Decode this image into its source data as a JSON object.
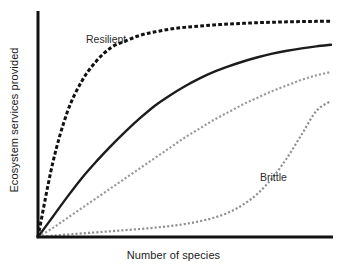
{
  "chart_data": {
    "type": "line",
    "title": "",
    "subtitle": "",
    "xlabel": "Number of species",
    "ylabel": "Ecosystem services provided",
    "xlim": [
      0,
      100
    ],
    "ylim": [
      0,
      100
    ],
    "grid": false,
    "axis_ticks": false,
    "tick_labels": {
      "x": [],
      "y": []
    },
    "legend": "none",
    "annotations": [
      {
        "text": "Resilient",
        "x": 17,
        "y": 88,
        "series": "resilient"
      },
      {
        "text": "Brittle",
        "x": 75,
        "y": 29,
        "series": "brittle"
      }
    ],
    "x": [
      0,
      5,
      10,
      15,
      20,
      25,
      30,
      35,
      40,
      45,
      50,
      55,
      60,
      65,
      70,
      75,
      80,
      85,
      90,
      95,
      100
    ],
    "series": [
      {
        "name": "resilient",
        "label": "Resilient",
        "style": "dashed",
        "color": "#111111",
        "width": 3,
        "values": [
          0,
          33,
          56,
          70,
          79,
          85,
          88,
          90.5,
          92,
          93.2,
          94,
          94.6,
          95.1,
          95.5,
          95.8,
          96.1,
          96.3,
          96.5,
          96.6,
          96.7,
          96.8
        ]
      },
      {
        "name": "intermediate-solid",
        "label": "",
        "style": "solid",
        "color": "#1c1c1c",
        "width": 2.4,
        "values": [
          0,
          9,
          18,
          26.5,
          34,
          41,
          47.5,
          53.5,
          59,
          63.5,
          67.5,
          71,
          74,
          76.5,
          78.7,
          80.6,
          82.2,
          83.5,
          84.6,
          85.5,
          86.2
        ]
      },
      {
        "name": "intermediate-dotted",
        "label": "",
        "style": "dotted",
        "color": "#9a9a9a",
        "width": 2.2,
        "values": [
          0,
          4,
          8.5,
          13,
          17.5,
          22,
          26.5,
          31,
          35.5,
          40,
          44.5,
          48.5,
          52.5,
          56,
          59.5,
          62.5,
          65.5,
          68,
          70.5,
          72.5,
          74
        ]
      },
      {
        "name": "brittle",
        "label": "Brittle",
        "style": "dotted",
        "color": "#8f8f8f",
        "width": 2.2,
        "values": [
          0,
          0.6,
          1.1,
          1.6,
          2.1,
          2.6,
          3.1,
          3.6,
          4.2,
          4.9,
          5.8,
          7.0,
          8.6,
          11.0,
          14.5,
          19.5,
          26.5,
          35.5,
          46.0,
          56.5,
          61.0
        ]
      }
    ],
    "axes": {
      "color": "#111111",
      "x_axis_width": 3,
      "y_axis_width": 3
    }
  }
}
